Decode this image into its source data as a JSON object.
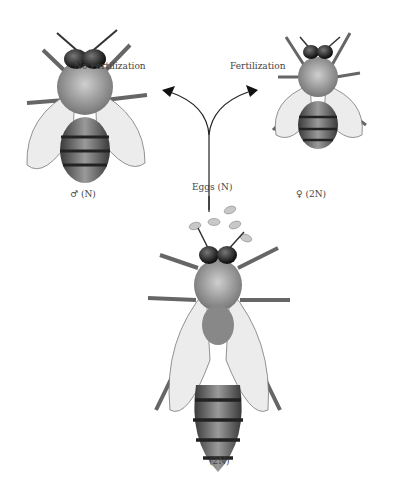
{
  "diagram": {
    "labels": {
      "no_fertilization": "No Fertilization",
      "fertilization": "Fertilization",
      "eggs": "Eggs (N)",
      "male": "♂ (N)",
      "female": "♀ (2N)",
      "queen": "(2N)"
    },
    "nodes": [
      {
        "id": "drone",
        "label": "♂ (N)",
        "description": "Male drone bee, haploid"
      },
      {
        "id": "worker",
        "label": "♀ (2N)",
        "description": "Female worker bee, diploid"
      },
      {
        "id": "queen",
        "label": "(2N)",
        "description": "Queen bee, diploid, laying eggs"
      }
    ],
    "edges": [
      {
        "from": "queen",
        "to": "drone",
        "label": "No Fertilization"
      },
      {
        "from": "queen",
        "to": "worker",
        "label": "Fertilization"
      }
    ],
    "colors": {
      "ink": "#2a2a2a",
      "wing": "#e6e6e6",
      "text": "#444444"
    }
  }
}
